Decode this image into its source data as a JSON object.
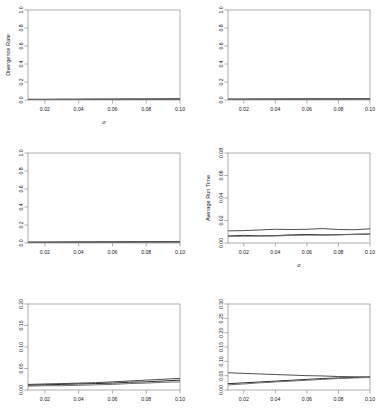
{
  "figure": {
    "name": "six-panel-line-chart-grid",
    "rows": 3,
    "cols": 2,
    "background": "#ffffff",
    "line_colors": [
      "#4d4d4d",
      "#2b2b2b",
      "#6e6e6e"
    ]
  },
  "chart_data": [
    {
      "id": "panel-top-left",
      "type": "line",
      "title": "",
      "xlabel": "σ",
      "ylabel": "Divergence Rate",
      "xlim": [
        0.01,
        0.1
      ],
      "ylim": [
        0.0,
        1.0
      ],
      "xticks": [
        0.02,
        0.04,
        0.06,
        0.08,
        0.1
      ],
      "xtick_labels": [
        "0.02",
        "0.04",
        "0.06",
        "0.08",
        "0.10"
      ],
      "yticks": [
        0.0,
        0.2,
        0.4,
        0.6,
        0.8,
        1.0
      ],
      "ytick_labels": [
        "0.0",
        "0.2",
        "0.4",
        "0.6",
        "0.8",
        "1.0"
      ],
      "grid": false,
      "legend": "none",
      "x": [
        0.01,
        0.02,
        0.03,
        0.04,
        0.05,
        0.06,
        0.07,
        0.08,
        0.09,
        0.1
      ],
      "series": [
        {
          "name": "series-1",
          "values": [
            0.008,
            0.008,
            0.009,
            0.009,
            0.01,
            0.01,
            0.011,
            0.011,
            0.012,
            0.013
          ]
        },
        {
          "name": "series-2",
          "values": [
            0.006,
            0.006,
            0.007,
            0.007,
            0.008,
            0.008,
            0.009,
            0.009,
            0.01,
            0.011
          ]
        },
        {
          "name": "series-3",
          "values": [
            0.005,
            0.005,
            0.006,
            0.006,
            0.007,
            0.007,
            0.008,
            0.008,
            0.009,
            0.009
          ]
        }
      ]
    },
    {
      "id": "panel-top-right",
      "type": "line",
      "title": "",
      "xlabel": "",
      "ylabel": "",
      "xlim": [
        0.01,
        0.1
      ],
      "ylim": [
        0.0,
        1.0
      ],
      "xticks": [
        0.02,
        0.04,
        0.06,
        0.08,
        0.1
      ],
      "xtick_labels": [
        "0.02",
        "0.04",
        "0.06",
        "0.08",
        "0.10"
      ],
      "yticks": [
        0.0,
        0.2,
        0.4,
        0.6,
        0.8,
        1.0
      ],
      "ytick_labels": [
        "0.0",
        "0.2",
        "0.4",
        "0.6",
        "0.8",
        "1.0"
      ],
      "grid": false,
      "legend": "none",
      "x": [
        0.01,
        0.02,
        0.03,
        0.04,
        0.05,
        0.06,
        0.07,
        0.08,
        0.09,
        0.1
      ],
      "series": [
        {
          "name": "series-1",
          "values": [
            0.01,
            0.01,
            0.011,
            0.011,
            0.012,
            0.012,
            0.013,
            0.013,
            0.014,
            0.015
          ]
        },
        {
          "name": "series-2",
          "values": [
            0.008,
            0.008,
            0.009,
            0.009,
            0.01,
            0.01,
            0.011,
            0.011,
            0.012,
            0.012
          ]
        },
        {
          "name": "series-3",
          "values": [
            0.006,
            0.007,
            0.007,
            0.008,
            0.008,
            0.009,
            0.009,
            0.01,
            0.01,
            0.011
          ]
        }
      ]
    },
    {
      "id": "panel-middle-left",
      "type": "line",
      "title": "",
      "xlabel": "",
      "ylabel": "",
      "xlim": [
        0.01,
        0.1
      ],
      "ylim": [
        0.0,
        1.0
      ],
      "xticks": [
        0.02,
        0.04,
        0.06,
        0.08,
        0.1
      ],
      "xtick_labels": [
        "0.02",
        "0.04",
        "0.06",
        "0.08",
        "0.10"
      ],
      "yticks": [
        0.0,
        0.2,
        0.4,
        0.6,
        0.8,
        1.0
      ],
      "ytick_labels": [
        "0.0",
        "0.2",
        "0.4",
        "0.6",
        "0.8",
        "1.0"
      ],
      "grid": false,
      "legend": "none",
      "x": [
        0.01,
        0.02,
        0.03,
        0.04,
        0.05,
        0.06,
        0.07,
        0.08,
        0.09,
        0.1
      ],
      "series": [
        {
          "name": "series-1",
          "values": [
            0.01,
            0.01,
            0.011,
            0.012,
            0.012,
            0.013,
            0.014,
            0.014,
            0.015,
            0.016
          ]
        },
        {
          "name": "series-2",
          "values": [
            0.008,
            0.008,
            0.009,
            0.009,
            0.01,
            0.011,
            0.011,
            0.012,
            0.012,
            0.013
          ]
        },
        {
          "name": "series-3",
          "values": [
            0.006,
            0.007,
            0.007,
            0.008,
            0.008,
            0.009,
            0.009,
            0.01,
            0.01,
            0.011
          ]
        }
      ]
    },
    {
      "id": "panel-middle-right",
      "type": "line",
      "title": "",
      "xlabel": "σ",
      "ylabel": "Average Run Time",
      "xlim": [
        0.01,
        0.1
      ],
      "ylim": [
        0.0,
        0.08
      ],
      "xticks": [
        0.02,
        0.04,
        0.06,
        0.08,
        0.1
      ],
      "xtick_labels": [
        "0.02",
        "0.04",
        "0.06",
        "0.08",
        "0.10"
      ],
      "yticks": [
        0.0,
        0.02,
        0.04,
        0.06,
        0.08
      ],
      "ytick_labels": [
        "0.00",
        "0.02",
        "0.04",
        "0.06",
        "0.08"
      ],
      "grid": false,
      "legend": "none",
      "x": [
        0.01,
        0.02,
        0.03,
        0.04,
        0.05,
        0.06,
        0.07,
        0.08,
        0.09,
        0.1
      ],
      "series": [
        {
          "name": "series-1",
          "values": [
            0.0108,
            0.011,
            0.0116,
            0.0122,
            0.012,
            0.0122,
            0.0128,
            0.012,
            0.0118,
            0.0126
          ]
        },
        {
          "name": "series-2",
          "values": [
            0.0062,
            0.0068,
            0.0064,
            0.0066,
            0.0072,
            0.0076,
            0.0072,
            0.0074,
            0.0078,
            0.008
          ]
        },
        {
          "name": "series-3",
          "values": [
            0.006,
            0.006,
            0.0062,
            0.0062,
            0.0068,
            0.007,
            0.007,
            0.0072,
            0.0076,
            0.0078
          ]
        }
      ]
    },
    {
      "id": "panel-bottom-left",
      "type": "line",
      "title": "",
      "xlabel": "",
      "ylabel": "",
      "xlim": [
        0.01,
        0.1
      ],
      "ylim": [
        0.0,
        0.2
      ],
      "xticks": [
        0.02,
        0.04,
        0.06,
        0.08,
        0.1
      ],
      "xtick_labels": [
        "0.02",
        "0.04",
        "0.06",
        "0.08",
        "0.10"
      ],
      "yticks": [
        0.0,
        0.05,
        0.1,
        0.15,
        0.2
      ],
      "ytick_labels": [
        "0.00",
        "0.05",
        "0.10",
        "0.15",
        "0.20"
      ],
      "grid": false,
      "legend": "none",
      "x": [
        0.01,
        0.02,
        0.03,
        0.04,
        0.05,
        0.06,
        0.07,
        0.08,
        0.09,
        0.1
      ],
      "series": [
        {
          "name": "series-1",
          "values": [
            0.013,
            0.014,
            0.015,
            0.016,
            0.017,
            0.019,
            0.021,
            0.023,
            0.025,
            0.027
          ]
        },
        {
          "name": "series-2",
          "values": [
            0.011,
            0.012,
            0.013,
            0.014,
            0.015,
            0.016,
            0.018,
            0.019,
            0.021,
            0.023
          ]
        },
        {
          "name": "series-3",
          "values": [
            0.009,
            0.01,
            0.01,
            0.011,
            0.012,
            0.013,
            0.015,
            0.016,
            0.018,
            0.019
          ]
        }
      ]
    },
    {
      "id": "panel-bottom-right",
      "type": "line",
      "title": "",
      "xlabel": "",
      "ylabel": "",
      "xlim": [
        0.01,
        0.1
      ],
      "ylim": [
        0.0,
        0.3
      ],
      "xticks": [
        0.02,
        0.04,
        0.06,
        0.08,
        0.1
      ],
      "xtick_labels": [
        "0.02",
        "0.04",
        "0.06",
        "0.08",
        "0.10"
      ],
      "yticks": [
        0.0,
        0.05,
        0.1,
        0.15,
        0.2,
        0.25,
        0.3
      ],
      "ytick_labels": [
        "0.00",
        "0.05",
        "0.10",
        "0.15",
        "0.20",
        "0.25",
        "0.30"
      ],
      "grid": false,
      "legend": "none",
      "x": [
        0.01,
        0.02,
        0.03,
        0.04,
        0.05,
        0.06,
        0.07,
        0.08,
        0.09,
        0.1
      ],
      "series": [
        {
          "name": "series-1",
          "values": [
            0.06,
            0.058,
            0.056,
            0.054,
            0.052,
            0.05,
            0.049,
            0.047,
            0.046,
            0.045
          ]
        },
        {
          "name": "series-2",
          "values": [
            0.022,
            0.025,
            0.028,
            0.031,
            0.034,
            0.037,
            0.04,
            0.042,
            0.044,
            0.045
          ]
        },
        {
          "name": "series-3",
          "values": [
            0.018,
            0.021,
            0.025,
            0.028,
            0.031,
            0.034,
            0.037,
            0.04,
            0.042,
            0.044
          ]
        }
      ]
    }
  ]
}
